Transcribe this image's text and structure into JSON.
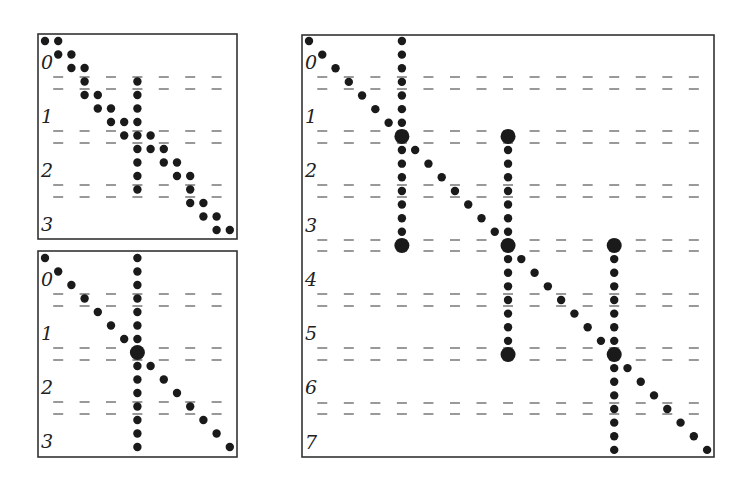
{
  "colors": {
    "ink": "#1a1a1a",
    "dash": "#555555",
    "frame": "#333333",
    "background": "#ffffff"
  },
  "panels": [
    {
      "id": "panel-a",
      "frame": {
        "x": 38,
        "y": 34,
        "w": 199,
        "h": 205
      },
      "grid": {
        "x0": 45,
        "y0": 41,
        "dx": 13.2,
        "dy": 13.5
      },
      "labels": [
        "0",
        "1",
        "2",
        "3"
      ],
      "label_rows_y": [
        62,
        116,
        170,
        224
      ],
      "dash_rows_y": [
        [
          77,
          89
        ],
        [
          131,
          143
        ],
        [
          185,
          197
        ]
      ],
      "dash_cols": [
        1,
        3,
        5,
        7,
        9,
        11,
        13
      ],
      "dots": [
        [
          0,
          0
        ],
        [
          0,
          1
        ],
        [
          1,
          1
        ],
        [
          1,
          2
        ],
        [
          2,
          2
        ],
        [
          2,
          3
        ],
        [
          3,
          3
        ],
        [
          3,
          7
        ],
        [
          4,
          3
        ],
        [
          4,
          4
        ],
        [
          4,
          7
        ],
        [
          5,
          4
        ],
        [
          5,
          5
        ],
        [
          5,
          7
        ],
        [
          6,
          5
        ],
        [
          6,
          6
        ],
        [
          6,
          7
        ],
        [
          7,
          6
        ],
        [
          7,
          7
        ],
        [
          7,
          8
        ],
        [
          8,
          7
        ],
        [
          8,
          8
        ],
        [
          8,
          9
        ],
        [
          9,
          7
        ],
        [
          9,
          9
        ],
        [
          9,
          10
        ],
        [
          10,
          7
        ],
        [
          10,
          10
        ],
        [
          10,
          11
        ],
        [
          11,
          7
        ],
        [
          11,
          11
        ],
        [
          12,
          11
        ],
        [
          12,
          12
        ],
        [
          13,
          12
        ],
        [
          13,
          13
        ],
        [
          14,
          13
        ],
        [
          14,
          14
        ]
      ],
      "big_dots": []
    },
    {
      "id": "panel-b",
      "frame": {
        "x": 38,
        "y": 251,
        "w": 199,
        "h": 206
      },
      "grid": {
        "x0": 45,
        "y0": 258,
        "dx": 13.2,
        "dy": 13.5
      },
      "labels": [
        "0",
        "1",
        "2",
        "3"
      ],
      "label_rows_y": [
        279,
        333,
        387,
        441
      ],
      "dash_rows_y": [
        [
          294,
          306
        ],
        [
          348,
          360
        ],
        [
          402,
          414
        ]
      ],
      "dash_cols": [
        1,
        3,
        5,
        7,
        9,
        11,
        13
      ],
      "dots": [
        [
          0,
          0
        ],
        [
          1,
          1
        ],
        [
          2,
          2
        ],
        [
          3,
          3
        ],
        [
          4,
          4
        ],
        [
          5,
          5
        ],
        [
          6,
          6
        ],
        [
          8,
          8
        ],
        [
          9,
          9
        ],
        [
          10,
          10
        ],
        [
          11,
          11
        ],
        [
          12,
          12
        ],
        [
          13,
          13
        ],
        [
          14,
          14
        ],
        [
          0,
          7
        ],
        [
          1,
          7
        ],
        [
          2,
          7
        ],
        [
          3,
          7
        ],
        [
          4,
          7
        ],
        [
          5,
          7
        ],
        [
          6,
          7
        ],
        [
          8,
          7
        ],
        [
          9,
          7
        ],
        [
          10,
          7
        ],
        [
          11,
          7
        ],
        [
          12,
          7
        ],
        [
          13,
          7
        ],
        [
          14,
          7
        ]
      ],
      "big_dots": [
        [
          7,
          7
        ]
      ]
    },
    {
      "id": "panel-c",
      "frame": {
        "x": 302,
        "y": 35,
        "w": 412,
        "h": 422
      },
      "grid": {
        "x0": 309,
        "y0": 41,
        "dx": 13.27,
        "dy": 13.63
      },
      "labels": [
        "0",
        "1",
        "2",
        "3",
        "4",
        "5",
        "6",
        "7"
      ],
      "label_rows_y": [
        62,
        116,
        170,
        225,
        279,
        333,
        387,
        442
      ],
      "dash_rows_y": [
        [
          77,
          89
        ],
        [
          131,
          143
        ],
        [
          185,
          197
        ],
        [
          240,
          251
        ],
        [
          294,
          306
        ],
        [
          348,
          360
        ],
        [
          403,
          414
        ]
      ],
      "dash_cols": [
        1,
        3,
        5,
        7,
        9,
        11,
        13,
        15,
        17,
        19,
        21,
        23,
        25,
        27,
        29
      ],
      "dots": [
        [
          0,
          0
        ],
        [
          1,
          1
        ],
        [
          2,
          2
        ],
        [
          3,
          3
        ],
        [
          4,
          4
        ],
        [
          5,
          5
        ],
        [
          6,
          6
        ],
        [
          8,
          8
        ],
        [
          9,
          9
        ],
        [
          10,
          10
        ],
        [
          11,
          11
        ],
        [
          12,
          12
        ],
        [
          13,
          13
        ],
        [
          14,
          14
        ],
        [
          16,
          16
        ],
        [
          17,
          17
        ],
        [
          18,
          18
        ],
        [
          19,
          19
        ],
        [
          20,
          20
        ],
        [
          21,
          21
        ],
        [
          22,
          22
        ],
        [
          24,
          24
        ],
        [
          25,
          25
        ],
        [
          26,
          26
        ],
        [
          27,
          27
        ],
        [
          28,
          28
        ],
        [
          29,
          29
        ],
        [
          30,
          30
        ],
        [
          0,
          7
        ],
        [
          1,
          7
        ],
        [
          2,
          7
        ],
        [
          3,
          7
        ],
        [
          4,
          7
        ],
        [
          5,
          7
        ],
        [
          6,
          7
        ],
        [
          8,
          7
        ],
        [
          9,
          7
        ],
        [
          10,
          7
        ],
        [
          11,
          7
        ],
        [
          12,
          7
        ],
        [
          13,
          7
        ],
        [
          14,
          7
        ],
        [
          8,
          15
        ],
        [
          9,
          15
        ],
        [
          10,
          15
        ],
        [
          11,
          15
        ],
        [
          12,
          15
        ],
        [
          13,
          15
        ],
        [
          14,
          15
        ],
        [
          16,
          15
        ],
        [
          17,
          15
        ],
        [
          18,
          15
        ],
        [
          19,
          15
        ],
        [
          20,
          15
        ],
        [
          21,
          15
        ],
        [
          22,
          15
        ],
        [
          16,
          23
        ],
        [
          17,
          23
        ],
        [
          18,
          23
        ],
        [
          19,
          23
        ],
        [
          20,
          23
        ],
        [
          21,
          23
        ],
        [
          22,
          23
        ],
        [
          24,
          23
        ],
        [
          25,
          23
        ],
        [
          26,
          23
        ],
        [
          27,
          23
        ],
        [
          28,
          23
        ],
        [
          29,
          23
        ],
        [
          30,
          23
        ]
      ],
      "big_dots": [
        [
          7,
          7
        ],
        [
          15,
          7
        ],
        [
          7,
          15
        ],
        [
          15,
          15
        ],
        [
          23,
          15
        ],
        [
          15,
          23
        ],
        [
          23,
          23
        ]
      ]
    }
  ]
}
